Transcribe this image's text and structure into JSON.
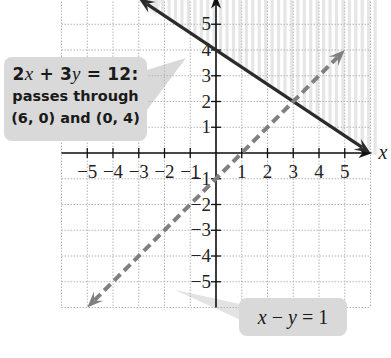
{
  "chart_data": {
    "type": "line",
    "title": "",
    "xlabel": "x",
    "ylabel": "y",
    "xlim": [
      -6,
      6
    ],
    "ylim": [
      -6,
      6
    ],
    "grid": true,
    "x_ticks": [
      -5,
      -4,
      -3,
      -2,
      -1,
      1,
      2,
      3,
      4,
      5
    ],
    "y_ticks": [
      -5,
      -4,
      -3,
      -2,
      -1,
      1,
      2,
      3,
      4,
      5
    ],
    "x_tick_labels": [
      "−5",
      "−4",
      "−3",
      "−2",
      "−1",
      "1",
      "2",
      "3",
      "4",
      "5"
    ],
    "y_tick_labels": [
      "−5",
      "−4",
      "−3",
      "−2",
      "−1",
      "1",
      "2",
      "3",
      "4",
      "5"
    ],
    "series": [
      {
        "name": "2x + 3y = 12",
        "style": "solid",
        "color": "#2b2b2b",
        "points": [
          [
            -3,
            6
          ],
          [
            0,
            4
          ],
          [
            3,
            2
          ],
          [
            6,
            0
          ]
        ],
        "arrows": "both"
      },
      {
        "name": "x − y = 1",
        "style": "dashed",
        "color": "#808080",
        "points": [
          [
            -5,
            -6
          ],
          [
            0,
            -1
          ],
          [
            1,
            0
          ],
          [
            3,
            2
          ],
          [
            5,
            4
          ]
        ],
        "arrows": "both"
      }
    ],
    "intersection": [
      3,
      2
    ],
    "shaded_region": "above 2x + 3y = 12 (vertical stripes)",
    "annotations": [
      {
        "text": "2x + 3y = 12: passes through (6, 0) and (0, 4)",
        "target": "solid line"
      },
      {
        "text": "x − y = 1",
        "target": "dashed line"
      }
    ]
  },
  "callouts": {
    "solid": {
      "eq_a": "2",
      "eq_x": "x",
      "eq_mid": " + 3",
      "eq_y": "y",
      "eq_end": " = 12:",
      "line2": "passes through",
      "line3": "(6, 0) and (0, 4)"
    },
    "dashed": {
      "x": "x",
      "mid": " − ",
      "y": "y",
      "end": " = 1"
    }
  },
  "axes": {
    "x_label": "x",
    "y_label": "y"
  }
}
